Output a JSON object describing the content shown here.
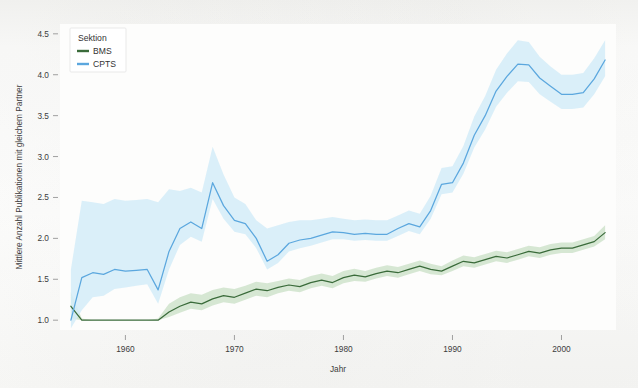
{
  "figure": {
    "background_color": "#f9f9f7",
    "plot_background_color": "#fdfdfc"
  },
  "legend": {
    "title": "Sektion",
    "position": "top-left-inside",
    "entries": [
      {
        "label": "BMS",
        "color": "#3a6b3a"
      },
      {
        "label": "CPTS",
        "color": "#5ba7de"
      }
    ]
  },
  "chart_data": {
    "type": "line",
    "title": "",
    "xlabel": "Jahr",
    "ylabel": "Mittlere Anzahl Publikationen mit gleichem Partner",
    "xlim": [
      1954,
      2005
    ],
    "ylim": [
      0.88,
      4.62
    ],
    "xticks": [
      1960,
      1970,
      1980,
      1990,
      2000
    ],
    "yticks": [
      1.0,
      1.5,
      2.0,
      2.5,
      3.0,
      3.5,
      4.0,
      4.5
    ],
    "ytick_labels": [
      "1.0",
      "1.5",
      "2.0",
      "2.5",
      "3.0",
      "3.5",
      "4.0",
      "4.5"
    ],
    "xtick_labels": [
      "1960",
      "1970",
      "1980",
      "1990",
      "2000"
    ],
    "grid": false,
    "legend_position": "upper left",
    "x": [
      1955,
      1956,
      1957,
      1958,
      1959,
      1960,
      1961,
      1962,
      1963,
      1964,
      1965,
      1966,
      1967,
      1968,
      1969,
      1970,
      1971,
      1972,
      1973,
      1974,
      1975,
      1976,
      1977,
      1978,
      1979,
      1980,
      1981,
      1982,
      1983,
      1984,
      1985,
      1986,
      1987,
      1988,
      1989,
      1990,
      1991,
      1992,
      1993,
      1994,
      1995,
      1996,
      1997,
      1998,
      1999,
      2000,
      2001,
      2002,
      2003,
      2004
    ],
    "series": [
      {
        "name": "BMS",
        "color": "#3a6b3a",
        "band_color": "#cfe3cb",
        "values": [
          1.17,
          1.0,
          1.0,
          1.0,
          1.0,
          1.0,
          1.0,
          1.0,
          1.0,
          1.1,
          1.17,
          1.22,
          1.2,
          1.26,
          1.3,
          1.28,
          1.33,
          1.38,
          1.36,
          1.4,
          1.43,
          1.41,
          1.46,
          1.49,
          1.46,
          1.52,
          1.55,
          1.53,
          1.57,
          1.6,
          1.58,
          1.62,
          1.66,
          1.62,
          1.6,
          1.66,
          1.72,
          1.7,
          1.74,
          1.78,
          1.76,
          1.8,
          1.84,
          1.82,
          1.86,
          1.88,
          1.88,
          1.92,
          1.96,
          2.07
        ],
        "band_low": [
          1.02,
          1.0,
          1.0,
          1.0,
          1.0,
          1.0,
          1.0,
          1.0,
          1.0,
          1.04,
          1.09,
          1.14,
          1.12,
          1.18,
          1.22,
          1.2,
          1.25,
          1.3,
          1.28,
          1.33,
          1.36,
          1.34,
          1.39,
          1.42,
          1.39,
          1.45,
          1.48,
          1.47,
          1.51,
          1.54,
          1.52,
          1.56,
          1.6,
          1.56,
          1.55,
          1.6,
          1.66,
          1.64,
          1.68,
          1.72,
          1.7,
          1.74,
          1.78,
          1.76,
          1.8,
          1.82,
          1.82,
          1.86,
          1.9,
          1.99
        ],
        "band_high": [
          1.34,
          1.02,
          1.0,
          1.0,
          1.0,
          1.0,
          1.0,
          1.0,
          1.02,
          1.2,
          1.28,
          1.33,
          1.31,
          1.37,
          1.4,
          1.38,
          1.42,
          1.47,
          1.45,
          1.48,
          1.51,
          1.49,
          1.54,
          1.57,
          1.54,
          1.6,
          1.63,
          1.6,
          1.64,
          1.67,
          1.65,
          1.69,
          1.73,
          1.69,
          1.66,
          1.73,
          1.79,
          1.77,
          1.81,
          1.85,
          1.83,
          1.87,
          1.91,
          1.89,
          1.93,
          1.95,
          1.95,
          1.99,
          2.03,
          2.16
        ]
      },
      {
        "name": "CPTS",
        "color": "#5ba7de",
        "band_color": "#d4ecf8",
        "values": [
          1.0,
          1.52,
          1.58,
          1.56,
          1.62,
          1.6,
          1.61,
          1.62,
          1.37,
          1.84,
          2.12,
          2.2,
          2.12,
          2.68,
          2.4,
          2.22,
          2.18,
          2.0,
          1.72,
          1.8,
          1.94,
          1.98,
          2.0,
          2.04,
          2.08,
          2.07,
          2.05,
          2.06,
          2.05,
          2.05,
          2.12,
          2.18,
          2.14,
          2.34,
          2.66,
          2.68,
          2.92,
          3.26,
          3.5,
          3.8,
          3.98,
          4.13,
          4.12,
          3.96,
          3.86,
          3.76,
          3.76,
          3.78,
          3.95,
          4.18
        ],
        "band_low": [
          0.9,
          1.12,
          1.28,
          1.3,
          1.38,
          1.4,
          1.42,
          1.44,
          1.2,
          1.62,
          1.92,
          2.02,
          1.96,
          2.48,
          2.24,
          2.08,
          2.05,
          1.88,
          1.62,
          1.7,
          1.84,
          1.88,
          1.91,
          1.95,
          1.99,
          1.99,
          1.97,
          1.98,
          1.97,
          1.97,
          2.03,
          2.09,
          2.05,
          2.24,
          2.54,
          2.56,
          2.79,
          3.11,
          3.33,
          3.61,
          3.78,
          3.92,
          3.91,
          3.76,
          3.67,
          3.58,
          3.58,
          3.6,
          3.76,
          3.98
        ],
        "band_high": [
          1.62,
          2.46,
          2.44,
          2.42,
          2.48,
          2.46,
          2.47,
          2.48,
          2.44,
          2.6,
          2.58,
          2.62,
          2.56,
          3.12,
          2.78,
          2.5,
          2.42,
          2.22,
          2.12,
          2.16,
          2.2,
          2.22,
          2.22,
          2.24,
          2.26,
          2.24,
          2.22,
          2.23,
          2.22,
          2.22,
          2.28,
          2.34,
          2.3,
          2.52,
          2.86,
          2.88,
          3.13,
          3.49,
          3.74,
          4.06,
          4.26,
          4.42,
          4.4,
          4.22,
          4.1,
          4.0,
          4.0,
          4.02,
          4.2,
          4.42
        ]
      }
    ]
  }
}
